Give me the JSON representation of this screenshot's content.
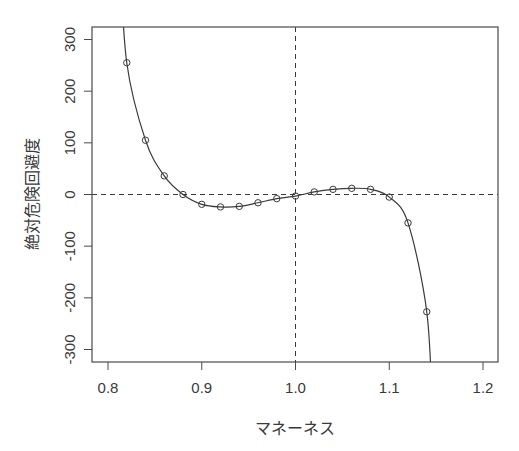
{
  "chart_data": {
    "type": "line",
    "title": "",
    "xlabel": "マネーネス",
    "ylabel": "絶対危険回避度",
    "xlim": [
      0.785,
      1.215
    ],
    "ylim": [
      -324,
      324
    ],
    "xticks": [
      0.8,
      0.9,
      1.0,
      1.1,
      1.2
    ],
    "xtick_labels": [
      "0.8",
      "0.9",
      "1.0",
      "1.1",
      "1.2"
    ],
    "yticks": [
      -300,
      -200,
      -100,
      0,
      100,
      200,
      300
    ],
    "ytick_labels": [
      "-300",
      "-200",
      "-100",
      "0",
      "100",
      "200",
      "300"
    ],
    "grid": false,
    "legend": null,
    "reference_lines": {
      "horizontal": {
        "y": 0,
        "style": "dashed"
      },
      "vertical": {
        "x": 1.0,
        "style": "dashed"
      }
    },
    "series": [
      {
        "name": "絶対危険回避度",
        "marker": "open-circle",
        "line": "solid",
        "x": [
          0.82,
          0.84,
          0.86,
          0.88,
          0.9,
          0.92,
          0.94,
          0.96,
          0.98,
          1.0,
          1.02,
          1.04,
          1.06,
          1.08,
          1.1,
          1.12,
          1.14
        ],
        "values": [
          255,
          105,
          36,
          0,
          -19,
          -24,
          -23,
          -16,
          -8,
          -3,
          5,
          10,
          12,
          10,
          -5,
          -55,
          -227
        ]
      }
    ],
    "curve_extends": {
      "left_exit_x": 0.816,
      "right_exit_x": 1.143
    }
  },
  "colors": {
    "line": "#3a3a3a",
    "frame": "#4a4a4a",
    "text": "#3a3a3a",
    "background": "#ffffff"
  }
}
